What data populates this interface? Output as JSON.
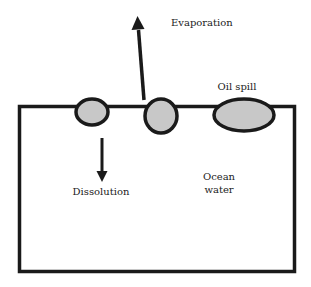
{
  "diagram": {
    "title": "",
    "colors": {
      "stroke": "#1a1a1a",
      "oil_fill": "#c8c8c8",
      "background": "#ffffff",
      "text": "#222222"
    },
    "labels": {
      "evaporation": "Evaporation",
      "oil_spill": "Oil spill",
      "dissolution": "Dissolution",
      "ocean_line1": "Ocean",
      "ocean_line2": "water"
    },
    "nodes": [
      {
        "id": "oil-droplet-left",
        "shape": "ellipse",
        "cx": 92,
        "cy": 112,
        "rx": 16,
        "ry": 13
      },
      {
        "id": "oil-droplet-middle",
        "shape": "ellipse",
        "cx": 161,
        "cy": 116,
        "rx": 16,
        "ry": 17
      },
      {
        "id": "oil-spill",
        "shape": "ellipse",
        "cx": 244,
        "cy": 115,
        "rx": 30,
        "ry": 16,
        "label": "Oil spill"
      }
    ],
    "edges": [
      {
        "id": "evaporation-arrow",
        "from": "oil-droplet-middle",
        "direction": "up",
        "label": "Evaporation"
      },
      {
        "id": "dissolution-arrow",
        "from": "oil-droplet-left",
        "direction": "down",
        "label": "Dissolution"
      }
    ],
    "region": {
      "id": "ocean-water",
      "label": "Ocean water"
    }
  }
}
